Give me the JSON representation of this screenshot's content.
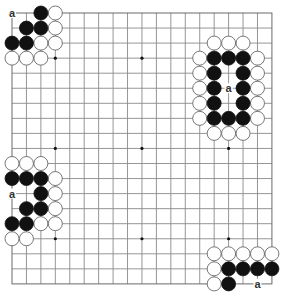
{
  "board": {
    "size": 19,
    "origin_x": 12,
    "origin_y": 13,
    "step_x": 14.44,
    "step_y": 15.05,
    "stone_radius": 7,
    "colors": {
      "line": "#8a8a8a",
      "black": "#111111",
      "white": "#ffffff",
      "stone_outline": "#555555",
      "label": "#333333"
    },
    "star_points": [
      [
        3,
        3
      ],
      [
        9,
        3
      ],
      [
        15,
        3
      ],
      [
        3,
        9
      ],
      [
        9,
        9
      ],
      [
        15,
        9
      ],
      [
        3,
        15
      ],
      [
        9,
        15
      ],
      [
        15,
        15
      ]
    ]
  },
  "stones": {
    "black": [
      [
        2,
        0
      ],
      [
        1,
        1
      ],
      [
        2,
        1
      ],
      [
        0,
        2
      ],
      [
        1,
        2
      ],
      [
        14,
        3
      ],
      [
        15,
        3
      ],
      [
        16,
        3
      ],
      [
        14,
        4
      ],
      [
        16,
        4
      ],
      [
        14,
        5
      ],
      [
        16,
        5
      ],
      [
        14,
        6
      ],
      [
        16,
        6
      ],
      [
        14,
        7
      ],
      [
        15,
        7
      ],
      [
        16,
        7
      ],
      [
        0,
        11
      ],
      [
        1,
        11
      ],
      [
        2,
        11
      ],
      [
        2,
        12
      ],
      [
        1,
        13
      ],
      [
        2,
        13
      ],
      [
        0,
        14
      ],
      [
        1,
        14
      ],
      [
        15,
        17
      ],
      [
        16,
        17
      ],
      [
        17,
        17
      ],
      [
        18,
        17
      ],
      [
        15,
        18
      ]
    ],
    "white": [
      [
        3,
        0
      ],
      [
        3,
        1
      ],
      [
        2,
        2
      ],
      [
        3,
        2
      ],
      [
        0,
        3
      ],
      [
        1,
        3
      ],
      [
        2,
        3
      ],
      [
        14,
        2
      ],
      [
        15,
        2
      ],
      [
        16,
        2
      ],
      [
        13,
        3
      ],
      [
        17,
        3
      ],
      [
        13,
        4
      ],
      [
        17,
        4
      ],
      [
        13,
        5
      ],
      [
        17,
        5
      ],
      [
        13,
        6
      ],
      [
        17,
        6
      ],
      [
        13,
        7
      ],
      [
        17,
        7
      ],
      [
        14,
        8
      ],
      [
        15,
        8
      ],
      [
        16,
        8
      ],
      [
        0,
        10
      ],
      [
        1,
        10
      ],
      [
        2,
        10
      ],
      [
        3,
        11
      ],
      [
        3,
        12
      ],
      [
        3,
        13
      ],
      [
        2,
        14
      ],
      [
        3,
        14
      ],
      [
        0,
        15
      ],
      [
        1,
        15
      ],
      [
        14,
        16
      ],
      [
        15,
        16
      ],
      [
        16,
        16
      ],
      [
        17,
        16
      ],
      [
        18,
        16
      ],
      [
        14,
        17
      ],
      [
        14,
        18
      ]
    ]
  },
  "labels": [
    {
      "text": "a",
      "col": 0,
      "row": 0
    },
    {
      "text": "a",
      "col": 15,
      "row": 5
    },
    {
      "text": "a",
      "col": 0,
      "row": 12
    },
    {
      "text": "a",
      "col": 17,
      "row": 18
    }
  ]
}
